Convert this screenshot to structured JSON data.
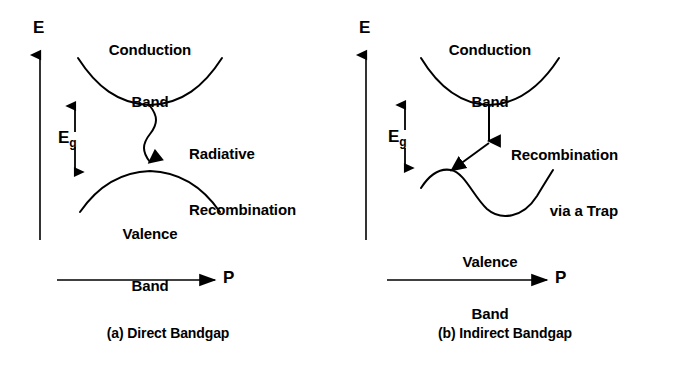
{
  "figure": {
    "background_color": "#ffffff",
    "ink_color": "#000000"
  },
  "panels": [
    {
      "id": "direct",
      "caption": "(a) Direct Bandgap",
      "energy_axis_label": "E",
      "momentum_axis_label": "P",
      "conduction_band_label": "Conduction\nBand",
      "conduction_band_label_line1": "Conduction",
      "conduction_band_label_line2": "Band",
      "valence_band_label_line1": "Valence",
      "valence_band_label_line2": "Band",
      "gap_label": "E",
      "gap_label_subscript": "g",
      "process_label_line1": "Radiative",
      "process_label_line2": "Recombination",
      "transition_type": "wavy-photon-arrow",
      "transition_description": "Vertical wavy (photon) arrow from conduction band minimum straight down to valence band maximum"
    },
    {
      "id": "indirect",
      "caption": "(b) Indirect Bandgap",
      "energy_axis_label": "E",
      "momentum_axis_label": "P",
      "conduction_band_label_line1": "Conduction",
      "conduction_band_label_line2": "Band",
      "valence_band_label_line1": "Valence",
      "valence_band_label_line2": "Band",
      "gap_label": "E",
      "gap_label_subscript": "g",
      "process_label_line1": "Recombination",
      "process_label_line2": "via a Trap",
      "transition_type": "two-step-trap-arrows",
      "transition_description": "Straight vertical arrow from conduction band minimum down to a trap level, then a diagonal arrow down-left to the valence band local maximum"
    }
  ]
}
